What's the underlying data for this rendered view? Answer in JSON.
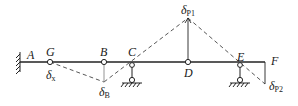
{
  "diagram": {
    "type": "influence-line / virtual displacement diagram of multi-span hinged beam",
    "points": {
      "A": {
        "label": "A"
      },
      "G": {
        "label": "G"
      },
      "B": {
        "label": "B"
      },
      "C": {
        "label": "C"
      },
      "D": {
        "label": "D"
      },
      "E": {
        "label": "E"
      },
      "F": {
        "label": "F"
      }
    },
    "displacements": {
      "x": {
        "symbol": "δ",
        "sub": "x"
      },
      "B": {
        "symbol": "δ",
        "sub": "B"
      },
      "P1": {
        "symbol": "δ",
        "sub": "P1"
      },
      "P2": {
        "symbol": "δ",
        "sub": "P2"
      }
    },
    "colors": {
      "line": "#222222",
      "dashed": "#444444",
      "background": "#ffffff"
    }
  }
}
